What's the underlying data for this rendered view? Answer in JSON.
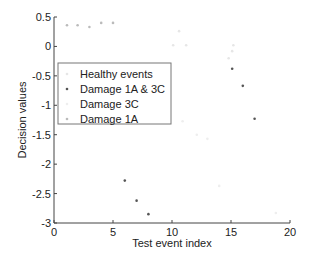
{
  "chart_data": {
    "type": "scatter",
    "title": "",
    "xlabel": "Test event index",
    "ylabel": "Decision values",
    "xlim": [
      0,
      20
    ],
    "ylim": [
      -3,
      0.5
    ],
    "xticks": [
      0,
      5,
      10,
      15,
      20
    ],
    "xtick_labels": [
      "0",
      "5",
      "10",
      "15",
      "20"
    ],
    "yticks": [
      -3,
      -2.5,
      -2,
      -1.5,
      -1,
      -0.5,
      0,
      0.5
    ],
    "ytick_labels": [
      "-3",
      "-2.5",
      "-2",
      "-1.5",
      "-1",
      "-0.5",
      "0",
      "0.5"
    ],
    "grid": false,
    "legend_position": "upper-left",
    "series": [
      {
        "name": "Healthy events",
        "color": "#e6e6e6",
        "points": [
          [
            10.1,
            0.02
          ],
          [
            11.2,
            0.02
          ],
          [
            10.6,
            0.26
          ],
          [
            15.2,
            0.02
          ],
          [
            15.1,
            -0.08
          ],
          [
            14.8,
            -0.2
          ]
        ]
      },
      {
        "name": "Damage 1A & 3C",
        "color": "#555555",
        "points": [
          [
            6,
            -2.28
          ],
          [
            7,
            -2.62
          ],
          [
            8,
            -2.85
          ],
          [
            15.1,
            -0.38
          ],
          [
            16,
            -0.67
          ],
          [
            17,
            -1.23
          ]
        ]
      },
      {
        "name": "Damage 3C",
        "color": "#eeeeee",
        "points": [
          [
            10.9,
            -1.27
          ],
          [
            12.1,
            -1.5
          ],
          [
            13,
            -1.57
          ],
          [
            14,
            -2.37
          ],
          [
            18.8,
            -2.83
          ]
        ]
      },
      {
        "name": "Damage 1A",
        "color": "#bbbbbb",
        "points": [
          [
            1.1,
            0.36
          ],
          [
            2,
            0.36
          ],
          [
            3,
            0.33
          ],
          [
            4,
            0.4
          ],
          [
            5,
            0.4
          ]
        ]
      }
    ]
  }
}
